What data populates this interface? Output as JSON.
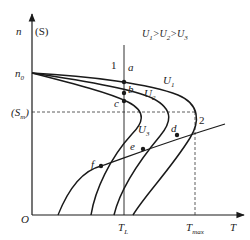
{
  "diagram": {
    "title": "U1>U2>U3",
    "axes": {
      "y_label": "n",
      "y_label_alt": "(S)",
      "x_label": "T",
      "origin": "O",
      "n0": "n",
      "n0_sub": "0",
      "sm": "(S",
      "sm_sub": "m",
      "sm_close": ")",
      "tl": "T",
      "tl_sub": "L",
      "tmax": "T",
      "tmax_sub": "max"
    },
    "curves": {
      "u1": "U",
      "u1_sub": "1",
      "u2": "U",
      "u2_sub": "2",
      "u3": "U",
      "u3_sub": "3"
    },
    "lines": {
      "line1": "1",
      "line2": "2"
    },
    "points": {
      "a": "a",
      "b": "b",
      "c": "c",
      "d": "d",
      "e": "e",
      "f": "f"
    },
    "condition": {
      "u": "U",
      "s1": "1",
      "gt1": ">",
      "u2": "U",
      "s2": "2",
      "gt2": ">",
      "u3": "U",
      "s3": "3"
    },
    "colors": {
      "stroke": "#1a1a1a",
      "background": "#ffffff"
    }
  }
}
